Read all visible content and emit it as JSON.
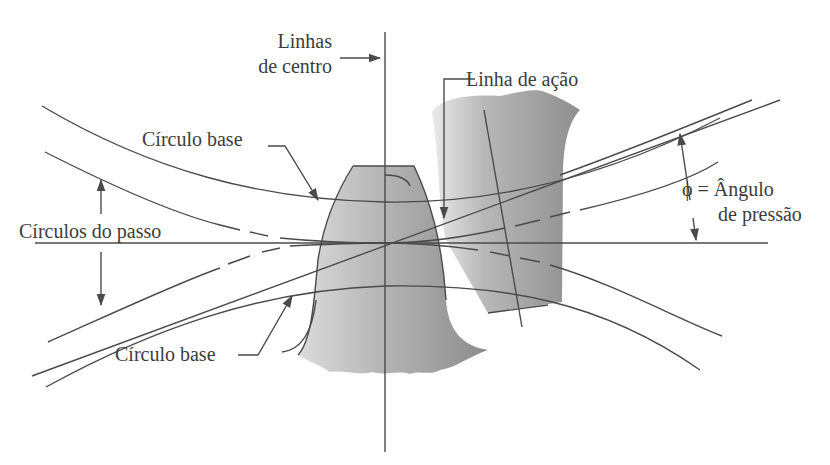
{
  "diagram": {
    "labels": {
      "center_lines": [
        "Linhas",
        "de centro"
      ],
      "line_of_action": "Linha de ação",
      "base_circle_top": "Círculo base",
      "pitch_circles": "Círculos do passo",
      "base_circle_bottom": "Círculo base",
      "pressure_angle_1": "ϕ = Ângulo",
      "pressure_angle_2": "de pressão"
    },
    "colors": {
      "line": "#4a4a4a",
      "text": "#3c3c3c",
      "tooth_light": "#d8d8d8",
      "tooth_dark": "#8a8a8a",
      "background": "#ffffff"
    }
  }
}
